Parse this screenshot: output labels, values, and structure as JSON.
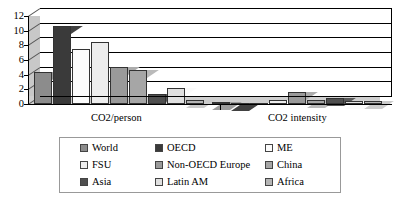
{
  "chart_data": {
    "type": "bar",
    "title": "",
    "xlabel": "",
    "ylabel": "",
    "ylim": [
      0,
      12
    ],
    "yticks": [
      0,
      2,
      4,
      6,
      8,
      10,
      12
    ],
    "grid": true,
    "legend_position": "bottom",
    "categories": [
      "CO2/person",
      "CO2 intensity"
    ],
    "series": [
      {
        "name": "World",
        "color": "#8c8c8c",
        "values": [
          4.3,
          0.25
        ]
      },
      {
        "name": "OECD",
        "color": "#3a3a3a",
        "values": [
          10.6,
          0.15
        ]
      },
      {
        "name": "ME",
        "color": "#fbfbfb",
        "values": [
          7.5,
          0.1
        ]
      },
      {
        "name": "FSU",
        "color": "#ededed",
        "values": [
          8.4,
          0.55
        ]
      },
      {
        "name": "Non-OECD Europe",
        "color": "#9a9a9a",
        "values": [
          5.0,
          1.6
        ]
      },
      {
        "name": "China",
        "color": "#a6a6a6",
        "values": [
          4.7,
          0.5
        ]
      },
      {
        "name": "Asia",
        "color": "#4f4f4f",
        "values": [
          1.3,
          0.85
        ]
      },
      {
        "name": "Latin AM",
        "color": "#e0e0e0",
        "values": [
          2.2,
          0.4
        ]
      },
      {
        "name": "Africa",
        "color": "#b5b5b5",
        "values": [
          0.6,
          0.45
        ]
      }
    ]
  },
  "legend": {
    "columns": [
      [
        "World",
        "FSU",
        "Asia"
      ],
      [
        "OECD",
        "Non-OECD Europe",
        "Latin AM"
      ],
      [
        "ME",
        "China",
        "Africa"
      ]
    ]
  },
  "colors": {
    "plot_background": "#d9d9d9",
    "axis": "#000000",
    "gridline": "#000000",
    "legend_border": "#999999"
  }
}
